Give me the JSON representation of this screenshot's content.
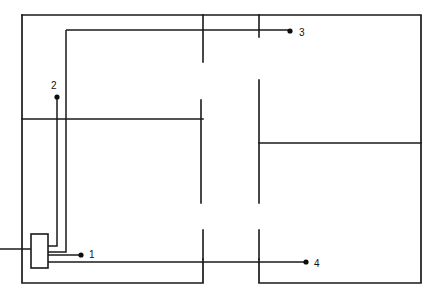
{
  "diagram": {
    "type": "floor-plan-schematic",
    "colors": {
      "wall": "#1a1a1a",
      "cable": "#1a1a1a",
      "dot": "#0d0d0d",
      "label": "#121212",
      "background": "#ffffff"
    },
    "terminals": [
      {
        "id": "1",
        "label": "1",
        "dot_x": 81,
        "dot_y": 255,
        "label_x": 89,
        "label_y": 255
      },
      {
        "id": "2",
        "label": "2",
        "dot_x": 57,
        "dot_y": 97,
        "label_x": 51,
        "label_y": 86
      },
      {
        "id": "3",
        "label": "3",
        "dot_x": 290,
        "dot_y": 33,
        "label_x": 299,
        "label_y": 33
      },
      {
        "id": "4",
        "label": "4",
        "dot_x": 306,
        "dot_y": 264,
        "label_x": 314,
        "label_y": 264
      }
    ],
    "device": {
      "name": "distribution-box",
      "x": 31,
      "y": 234,
      "width": 17,
      "height": 34
    },
    "outer_walls": [
      "M22,15 L421,15 L421,283 L259,283 L259,259",
      "M203,259 L203,283 L22,283 L22,15"
    ],
    "inner_walls": [
      "M203,15 L203,62",
      "M259,15 L259,37",
      "M22,119 L203,119",
      "M201,100 L201,203",
      "M259,80 L259,203",
      "M259,143 L421,143",
      "M203,230 L203,259",
      "M259,230 L259,259"
    ],
    "cables": [
      "M57,97 L57,246 L48,246",
      "M66,30 L66,252 L48,252",
      "M66,30 L290,30",
      "M0,249 L31,249",
      "M48,255 L81,255",
      "M48,262 L306,262"
    ]
  }
}
